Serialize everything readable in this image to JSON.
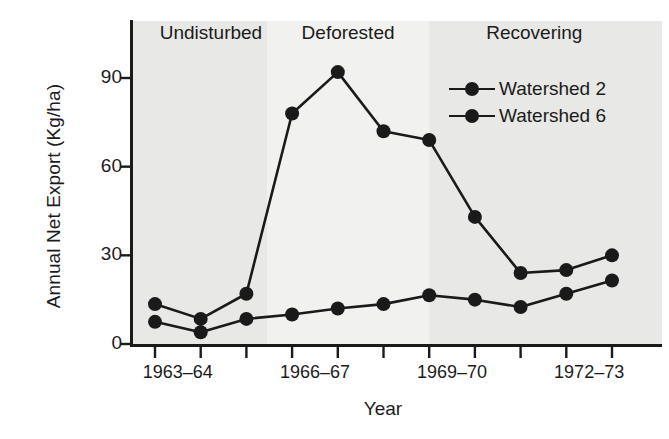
{
  "chart_data": {
    "type": "line",
    "title": "",
    "xlabel": "Year",
    "ylabel": "Annual Net Export (Kg/ha)",
    "ylim": [
      0,
      100
    ],
    "yticks": [
      0,
      30,
      60,
      90
    ],
    "ytick_labels": [
      "0",
      "30",
      "60",
      "90"
    ],
    "grid": false,
    "legend_position": "upper-right",
    "x": [
      "1963-64",
      "1964-65",
      "1965-66",
      "1966-67",
      "1967-68",
      "1968-69",
      "1969-70",
      "1970-71",
      "1971-72",
      "1972-73",
      "1973-74"
    ],
    "xtick_labels": [
      "1963–64",
      "1966–67",
      "1969–70",
      "1972–73"
    ],
    "xtick_label_positions": [
      0,
      3,
      6,
      9
    ],
    "series": [
      {
        "name": "Watershed 2",
        "color": "#1a1a1a",
        "values": [
          13.5,
          8.5,
          17,
          78,
          92,
          72,
          69,
          43,
          24,
          25,
          30
        ]
      },
      {
        "name": "Watershed 6",
        "color": "#1a1a1a",
        "values": [
          7.5,
          4,
          8.5,
          10,
          12,
          13.5,
          16.5,
          15,
          12.5,
          17,
          21.5
        ]
      }
    ],
    "annotations": [
      {
        "label": "Undisturbed",
        "span_start": 0,
        "span_end": 2.45,
        "band_color": "#e8e8e6"
      },
      {
        "label": "Deforested",
        "span_start": 2.45,
        "span_end": 6.0,
        "band_color": "#f1f1ef"
      },
      {
        "label": "Recovering",
        "span_start": 6.0,
        "span_end": 10.6,
        "band_color": "#e8e8e6"
      }
    ]
  }
}
